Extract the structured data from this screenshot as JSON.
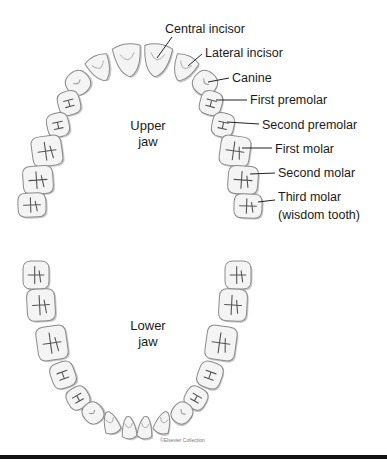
{
  "upper_jaw": {
    "label_line1": "Upper",
    "label_line2": "jaw",
    "tooth_labels": [
      {
        "id": "central-incisor",
        "text": "Central incisor",
        "x": 165,
        "y": 22,
        "lx1": 172,
        "ly1": 37,
        "lx2": 157,
        "ly2": 58
      },
      {
        "id": "lateral-incisor",
        "text": "Lateral incisor",
        "x": 205,
        "y": 46,
        "lx1": 202,
        "ly1": 54,
        "lx2": 188,
        "ly2": 66
      },
      {
        "id": "canine",
        "text": "Canine",
        "x": 232,
        "y": 71,
        "lx1": 229,
        "ly1": 78,
        "lx2": 208,
        "ly2": 82
      },
      {
        "id": "first-premolar",
        "text": "First premolar",
        "x": 250,
        "y": 93,
        "lx1": 247,
        "ly1": 100,
        "lx2": 216,
        "ly2": 100
      },
      {
        "id": "second-premolar",
        "text": "Second premolar",
        "x": 262,
        "y": 118,
        "lx1": 259,
        "ly1": 124,
        "lx2": 227,
        "ly2": 122
      },
      {
        "id": "first-molar",
        "text": "First molar",
        "x": 275,
        "y": 142,
        "lx1": 272,
        "ly1": 148,
        "lx2": 242,
        "ly2": 148
      },
      {
        "id": "second-molar",
        "text": "Second molar",
        "x": 278,
        "y": 166,
        "lx1": 275,
        "ly1": 173,
        "lx2": 250,
        "ly2": 174
      },
      {
        "id": "third-molar",
        "text": "Third molar",
        "x": 278,
        "y": 190,
        "lx1": 275,
        "ly1": 200,
        "lx2": 258,
        "ly2": 202
      },
      {
        "id": "wisdom-tooth",
        "text": "(wisdom tooth)",
        "x": 278,
        "y": 208
      }
    ],
    "teeth": [
      {
        "type": "central",
        "cx": 128,
        "cy": 60,
        "w": 28,
        "h": 32,
        "rot": -8
      },
      {
        "type": "central",
        "cx": 157,
        "cy": 60,
        "w": 28,
        "h": 32,
        "rot": 8
      },
      {
        "type": "lateral",
        "cx": 100,
        "cy": 68,
        "w": 24,
        "h": 26,
        "rot": -25
      },
      {
        "type": "lateral",
        "cx": 184,
        "cy": 68,
        "w": 24,
        "h": 26,
        "rot": 25
      },
      {
        "type": "canine",
        "cx": 78,
        "cy": 83,
        "w": 24,
        "h": 24,
        "rot": -40
      },
      {
        "type": "canine",
        "cx": 205,
        "cy": 83,
        "w": 24,
        "h": 24,
        "rot": 40
      },
      {
        "type": "premolar",
        "cx": 69,
        "cy": 103,
        "w": 22,
        "h": 24,
        "rot": -15
      },
      {
        "type": "premolar",
        "cx": 211,
        "cy": 103,
        "w": 22,
        "h": 24,
        "rot": 15
      },
      {
        "type": "premolar",
        "cx": 58,
        "cy": 125,
        "w": 22,
        "h": 24,
        "rot": -12
      },
      {
        "type": "premolar",
        "cx": 223,
        "cy": 125,
        "w": 22,
        "h": 24,
        "rot": 12
      },
      {
        "type": "molar",
        "cx": 47,
        "cy": 151,
        "w": 30,
        "h": 30,
        "rot": -8
      },
      {
        "type": "molar",
        "cx": 235,
        "cy": 151,
        "w": 30,
        "h": 30,
        "rot": 8
      },
      {
        "type": "molar",
        "cx": 38,
        "cy": 180,
        "w": 30,
        "h": 28,
        "rot": -4
      },
      {
        "type": "molar",
        "cx": 243,
        "cy": 180,
        "w": 30,
        "h": 28,
        "rot": 4
      },
      {
        "type": "molar",
        "cx": 32,
        "cy": 205,
        "w": 28,
        "h": 24,
        "rot": -2
      },
      {
        "type": "molar",
        "cx": 248,
        "cy": 206,
        "w": 28,
        "h": 24,
        "rot": 2
      }
    ]
  },
  "lower_jaw": {
    "label_line1": "Lower",
    "label_line2": "jaw",
    "teeth": [
      {
        "type": "molar",
        "cx": 36,
        "cy": 275,
        "w": 26,
        "h": 28,
        "rot": 0
      },
      {
        "type": "molar",
        "cx": 238,
        "cy": 275,
        "w": 26,
        "h": 28,
        "rot": 0
      },
      {
        "type": "molar",
        "cx": 41,
        "cy": 305,
        "w": 28,
        "h": 32,
        "rot": -3
      },
      {
        "type": "molar",
        "cx": 233,
        "cy": 305,
        "w": 28,
        "h": 32,
        "rot": 3
      },
      {
        "type": "molar",
        "cx": 52,
        "cy": 343,
        "w": 30,
        "h": 34,
        "rot": -8
      },
      {
        "type": "molar",
        "cx": 221,
        "cy": 343,
        "w": 30,
        "h": 34,
        "rot": 8
      },
      {
        "type": "premolar",
        "cx": 63,
        "cy": 375,
        "w": 24,
        "h": 26,
        "rot": -20
      },
      {
        "type": "premolar",
        "cx": 210,
        "cy": 375,
        "w": 24,
        "h": 26,
        "rot": 20
      },
      {
        "type": "premolar",
        "cx": 78,
        "cy": 398,
        "w": 22,
        "h": 22,
        "rot": -30
      },
      {
        "type": "premolar",
        "cx": 196,
        "cy": 398,
        "w": 22,
        "h": 22,
        "rot": 30
      },
      {
        "type": "canine",
        "cx": 93,
        "cy": 413,
        "w": 20,
        "h": 22,
        "rot": -40
      },
      {
        "type": "canine",
        "cx": 182,
        "cy": 413,
        "w": 20,
        "h": 22,
        "rot": 40
      },
      {
        "type": "lateral",
        "cx": 111,
        "cy": 423,
        "w": 16,
        "h": 22,
        "rot": -18
      },
      {
        "type": "lateral",
        "cx": 163,
        "cy": 423,
        "w": 16,
        "h": 22,
        "rot": 18
      },
      {
        "type": "central",
        "cx": 129,
        "cy": 428,
        "w": 15,
        "h": 22,
        "rot": -5
      },
      {
        "type": "central",
        "cx": 145,
        "cy": 428,
        "w": 15,
        "h": 22,
        "rot": 5
      }
    ]
  },
  "copyright": "©Elsevier Collection",
  "colors": {
    "tooth_fill": "#f4f4f4",
    "tooth_stroke": "#8a8a8a",
    "tooth_shadow": "#c9c9c9",
    "groove": "#555555",
    "text": "#1a1a1a",
    "bar": "#111111"
  }
}
